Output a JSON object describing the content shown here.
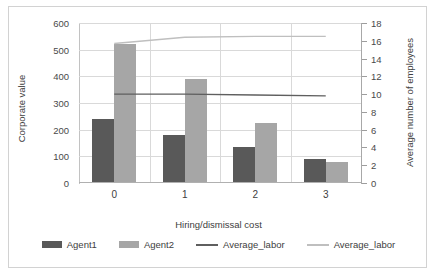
{
  "chart_data": {
    "type": "bar",
    "title": "",
    "xlabel": "Hiring/dismissal cost",
    "ylabel": "Corporate value",
    "y2label": "Average number of employees",
    "categories": [
      "0",
      "1",
      "2",
      "3"
    ],
    "ylim": [
      0,
      600
    ],
    "y2lim": [
      0,
      18
    ],
    "yticks": [
      0,
      100,
      200,
      300,
      400,
      500,
      600
    ],
    "y2ticks": [
      0,
      2,
      4,
      6,
      8,
      10,
      12,
      14,
      16,
      18
    ],
    "grid": true,
    "legend_position": "bottom",
    "series": [
      {
        "name": "Agent1",
        "kind": "bar",
        "axis": "left",
        "color": "#595959",
        "values": [
          240,
          180,
          135,
          90
        ]
      },
      {
        "name": "Agent2",
        "kind": "bar",
        "axis": "left",
        "color": "#a6a6a6",
        "values": [
          520,
          390,
          225,
          80
        ]
      },
      {
        "name": "Average_labor",
        "kind": "line",
        "axis": "right",
        "color": "#5f5f5f",
        "values": [
          10.0,
          10.0,
          9.9,
          9.8
        ]
      },
      {
        "name": "Average_labor",
        "kind": "line",
        "axis": "right",
        "color": "#bfbfbf",
        "values": [
          15.7,
          16.4,
          16.5,
          16.5
        ]
      }
    ]
  },
  "legend": {
    "items": [
      {
        "label": "Agent1",
        "swatch": "bar",
        "color": "#595959"
      },
      {
        "label": "Agent2",
        "swatch": "bar",
        "color": "#a6a6a6"
      },
      {
        "label": "Average_labor",
        "swatch": "line",
        "color": "#5f5f5f"
      },
      {
        "label": "Average_labor",
        "swatch": "line",
        "color": "#bfbfbf"
      }
    ]
  }
}
